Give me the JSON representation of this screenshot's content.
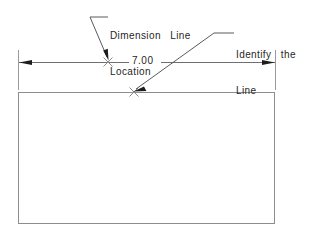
{
  "drawing": {
    "type": "technical-dimension-annotation",
    "background_color": "#ffffff",
    "line_color": "#8d8d8d",
    "text_color": "#1f1f1f",
    "arrow_color": "#1d1d1d"
  },
  "annotations": [
    {
      "id": "dimension-line-location",
      "line1": "Dimension  Line",
      "line2": "Location",
      "leader_target": "x-marker-on-dimension-line"
    },
    {
      "id": "identify-the-line",
      "line1": "Identify  the",
      "line2": "Line",
      "leader_target": "x-marker-on-object-line"
    }
  ],
  "dimension": {
    "value": "7.00",
    "units": "",
    "orientation": "horizontal"
  },
  "object": {
    "shape": "rectangle",
    "x": 18,
    "y": 92,
    "width": 257,
    "height": 132
  },
  "markers": [
    {
      "id": "x-marker-on-dimension-line",
      "x": 108,
      "y": 62
    },
    {
      "id": "x-marker-on-object-line",
      "x": 134,
      "y": 92
    }
  ]
}
